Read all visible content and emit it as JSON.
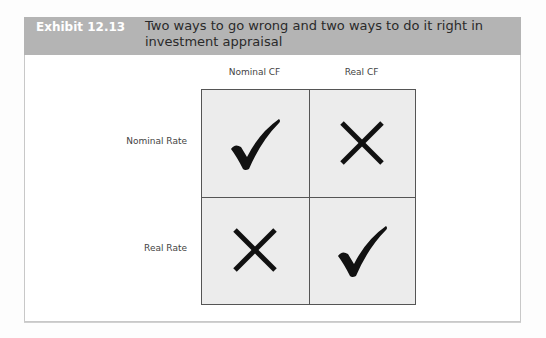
{
  "exhibit": {
    "label": "Exhibit 12.13",
    "title": "Two ways to go wrong and two ways to do it right in investment appraisal"
  },
  "matrix": {
    "columns": [
      "Nominal CF",
      "Real CF"
    ],
    "rows": [
      "Nominal Rate",
      "Real Rate"
    ],
    "cells": [
      [
        "check-icon",
        "cross-icon"
      ],
      [
        "cross-icon",
        "check-icon"
      ]
    ]
  },
  "colors": {
    "header_bg": "#b4b4b4",
    "cell_bg": "#ececec",
    "mark": "#111111"
  }
}
